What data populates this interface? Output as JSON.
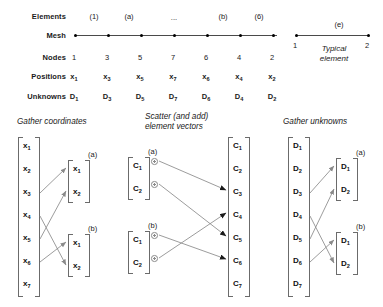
{
  "top": {
    "row_labels": {
      "elements": "Elements",
      "mesh": "Mesh",
      "nodes": "Nodes",
      "positions": "Positions",
      "unknowns": "Unknowns"
    },
    "element_tags": [
      "(1)",
      "(a)",
      "...",
      "(b)",
      "(6)"
    ],
    "nodes": [
      "1",
      "3",
      "5",
      "7",
      "6",
      "4",
      "2"
    ],
    "positions": [
      "x",
      "x",
      "x",
      "x",
      "x",
      "x",
      "x"
    ],
    "position_subs": [
      "1",
      "3",
      "5",
      "7",
      "6",
      "4",
      "2"
    ],
    "unknowns": [
      "D",
      "D",
      "D",
      "D",
      "D",
      "D",
      "D"
    ],
    "unknown_subs": [
      "1",
      "3",
      "5",
      "7",
      "6",
      "4",
      "2"
    ],
    "typical": {
      "tag": "(e)",
      "node_left": "1",
      "node_right": "2",
      "caption_line1": "Typical",
      "caption_line2": "element"
    }
  },
  "panels": {
    "gather_coordinates": {
      "title": "Gather coordinates",
      "global_symbol": "x",
      "global_subs": [
        "1",
        "2",
        "3",
        "4",
        "5",
        "6",
        "7"
      ],
      "elem_a": {
        "tag": "(a)",
        "symbol": "x",
        "subs": [
          "1",
          "2"
        ]
      },
      "elem_b": {
        "tag": "(b)",
        "symbol": "x",
        "subs": [
          "1",
          "2"
        ]
      },
      "mappings": [
        {
          "from": 3,
          "to": "a1"
        },
        {
          "from": 5,
          "to": "a2"
        },
        {
          "from": 4,
          "to": "b2"
        },
        {
          "from": 6,
          "to": "b1"
        }
      ]
    },
    "scatter_element_vectors": {
      "title_line1": "Scatter (and add)",
      "title_line2": "element vectors",
      "global_symbol": "C",
      "global_subs": [
        "1",
        "2",
        "3",
        "4",
        "5",
        "6",
        "7"
      ],
      "elem_a": {
        "tag": "(a)",
        "symbol": "C",
        "subs": [
          "1",
          "2"
        ],
        "accumulate_icon": "plus-circle"
      },
      "elem_b": {
        "tag": "(b)",
        "symbol": "C",
        "subs": [
          "1",
          "2"
        ],
        "accumulate_icon": "plus-circle"
      },
      "mappings": [
        {
          "from": "a1",
          "to": 3
        },
        {
          "from": "a2",
          "to": 5
        },
        {
          "from": "b1",
          "to": 6
        },
        {
          "from": "b2",
          "to": 4
        }
      ]
    },
    "gather_unknowns": {
      "title": "Gather unknowns",
      "global_symbol": "D",
      "global_subs": [
        "1",
        "2",
        "3",
        "4",
        "5",
        "6",
        "7"
      ],
      "elem_a": {
        "tag": "(a)",
        "symbol": "D",
        "subs": [
          "1",
          "2"
        ]
      },
      "elem_b": {
        "tag": "(b)",
        "symbol": "D",
        "subs": [
          "1",
          "2"
        ]
      },
      "mappings": [
        {
          "from": 3,
          "to": "a1"
        },
        {
          "from": 5,
          "to": "a2"
        },
        {
          "from": 4,
          "to": "b2"
        },
        {
          "from": 6,
          "to": "b1"
        }
      ]
    }
  },
  "colors": {
    "text": "#1a1a1a",
    "line": "#4a4a4a",
    "arrow": "#8a8a8a",
    "bracket": "#6b6b6b"
  }
}
